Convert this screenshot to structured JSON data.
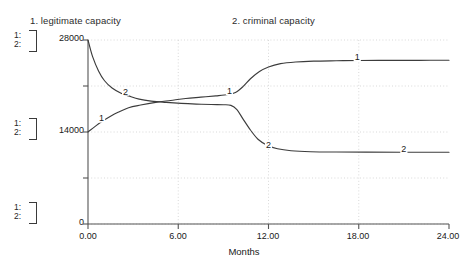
{
  "titles": {
    "series1": "1. legitimate capacity",
    "series2": "2. criminal capacity"
  },
  "legend_blocks": [
    {
      "row1": "1:",
      "row2": "2:"
    },
    {
      "row1": "1:",
      "row2": "2:"
    },
    {
      "row1": "1:",
      "row2": "2:"
    }
  ],
  "axes": {
    "y_top_label": "28000",
    "y_mid_label": "14000",
    "y_bottom_label": "0",
    "x_labels": [
      "0.00",
      "6.00",
      "12.00",
      "18.00",
      "24.00"
    ],
    "x_title": "Months"
  },
  "curve_labels": {
    "s1_left": "1",
    "s2_cross": "2",
    "s1_mid": "1",
    "s2_mid": "2",
    "s1_right": "1",
    "s2_right": "2"
  },
  "colors": {
    "background": "#ffffff",
    "axis": "#555555",
    "grid": "#cfcfcf",
    "curve": "#3c3c3c",
    "text": "#202020"
  },
  "chart_data": {
    "type": "line",
    "title": "",
    "xlabel": "Months",
    "ylabel": "",
    "xlim": [
      0,
      24
    ],
    "ylim": [
      0,
      28000
    ],
    "xticks": [
      0,
      6,
      12,
      18,
      24
    ],
    "yticks": [
      0,
      7000,
      14000,
      21000,
      28000
    ],
    "ytick_labels_shown": [
      "0",
      "14000",
      "28000"
    ],
    "grid": true,
    "grid_style": "dotted",
    "legend_position": "top",
    "series": [
      {
        "name": "1. legitimate capacity",
        "label": "1",
        "x": [
          0,
          0.5,
          1,
          1.5,
          2,
          2.7,
          3.5,
          4.5,
          5.5,
          6.5,
          7.5,
          8.5,
          9.3,
          9.8,
          10.3,
          10.8,
          11.4,
          12,
          12.8,
          13.8,
          15,
          16.5,
          18,
          20,
          22,
          24
        ],
        "values": [
          14000,
          14900,
          15700,
          16400,
          17000,
          17700,
          18100,
          18500,
          18800,
          19100,
          19300,
          19500,
          19700,
          20000,
          20900,
          22100,
          23200,
          23900,
          24400,
          24650,
          24780,
          24840,
          24880,
          24900,
          24910,
          24920
        ]
      },
      {
        "name": "2. criminal capacity",
        "label": "2",
        "x": [
          0,
          0.3,
          0.7,
          1.1,
          1.6,
          2.2,
          2.7,
          3.4,
          4.2,
          5.2,
          6.2,
          7.2,
          8.2,
          9,
          9.5,
          9.9,
          10.3,
          10.8,
          11.3,
          11.9,
          12.6,
          13.5,
          14.8,
          16.5,
          18.5,
          21,
          24
        ],
        "values": [
          28000,
          25500,
          23300,
          21800,
          20700,
          19900,
          19500,
          19000,
          18700,
          18500,
          18350,
          18250,
          18180,
          18150,
          18050,
          17400,
          16000,
          14300,
          12900,
          12000,
          11450,
          11150,
          11000,
          10950,
          10930,
          10920,
          10920
        ]
      }
    ],
    "annotations": [
      {
        "text": "1",
        "x": 0.9,
        "y": 15600
      },
      {
        "text": "2",
        "x": 2.5,
        "y": 19700
      },
      {
        "text": "1",
        "x": 9.4,
        "y": 19800
      },
      {
        "text": "2",
        "x": 12.0,
        "y": 11600
      },
      {
        "text": "1",
        "x": 17.9,
        "y": 24900
      },
      {
        "text": "2",
        "x": 21.0,
        "y": 10950
      }
    ]
  }
}
